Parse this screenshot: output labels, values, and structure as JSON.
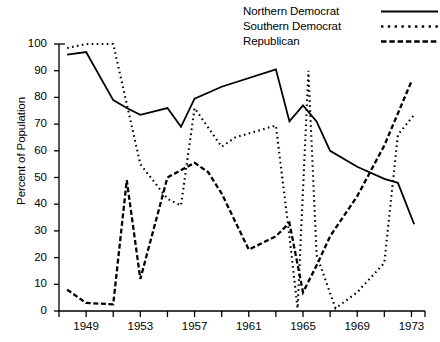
{
  "chart_data": {
    "type": "line",
    "title": "",
    "xlabel": "",
    "ylabel": "Percent of Population",
    "xlim": [
      1947,
      1974
    ],
    "ylim": [
      0,
      100
    ],
    "grid": false,
    "legend_position": "top-right",
    "x_tick_labels": [
      "1949",
      "1953",
      "1957",
      "1961",
      "1965",
      "1969",
      "1973"
    ],
    "x_tick_values": [
      1949,
      1953,
      1957,
      1961,
      1965,
      1969,
      1973
    ],
    "x_minor_tick_values": [
      1947,
      1951,
      1955,
      1959,
      1963,
      1967,
      1971
    ],
    "y_tick_labels": [
      "0",
      "10",
      "20",
      "30",
      "40",
      "50",
      "60",
      "70",
      "80",
      "90",
      "100"
    ],
    "y_tick_values": [
      0,
      10,
      20,
      30,
      40,
      50,
      60,
      70,
      80,
      90,
      100
    ],
    "x": [
      1947,
      1948,
      1949,
      1950,
      1951,
      1952,
      1953,
      1954,
      1955,
      1956,
      1957,
      1958,
      1959,
      1960,
      1961,
      1962,
      1963,
      1964,
      1965,
      1966,
      1967,
      1968,
      1969,
      1970,
      1971,
      1972,
      1973
    ],
    "series": [
      {
        "name": "Northern Democrat",
        "style": "solid",
        "color": "#000000",
        "x": [
          1947.6,
          1949,
          1951,
          1952,
          1953,
          1955,
          1956,
          1957,
          1959,
          1963,
          1964,
          1965,
          1966,
          1967,
          1969,
          1971,
          1972,
          1973.2
        ],
        "values": [
          96,
          97,
          79,
          76,
          73.5,
          76,
          69,
          79.5,
          84,
          90.5,
          71,
          77,
          71,
          60,
          54,
          49.5,
          48,
          32.5
        ]
      },
      {
        "name": "Southern Democrat",
        "style": "dotted",
        "color": "#000000",
        "x": [
          1947.6,
          1949,
          1951,
          1953,
          1955,
          1956,
          1957,
          1959,
          1960,
          1963,
          1964,
          1964.6,
          1965,
          1965.4,
          1966,
          1967.4,
          1969,
          1971,
          1972,
          1973.2
        ],
        "values": [
          98.5,
          100,
          100,
          55,
          42,
          39.5,
          76,
          61.5,
          65,
          69.5,
          28,
          1,
          45,
          90,
          21,
          1,
          7,
          18,
          66,
          73.5
        ]
      },
      {
        "name": "Republican",
        "style": "dashed",
        "color": "#000000",
        "x": [
          1947.6,
          1949,
          1951,
          1952,
          1953,
          1955,
          1957,
          1958,
          1959,
          1961,
          1963,
          1964,
          1965,
          1966,
          1967,
          1969,
          1971,
          1973
        ],
        "values": [
          8,
          3,
          2.5,
          49,
          12,
          50,
          55.5,
          52,
          44,
          23,
          28,
          33,
          7,
          17,
          28,
          43,
          62,
          86
        ]
      }
    ]
  },
  "legend": {
    "items": [
      {
        "label": "Northern Democrat",
        "style": "solid"
      },
      {
        "label": "Southern Democrat",
        "style": "dotted"
      },
      {
        "label": "Republican",
        "style": "dashed"
      }
    ]
  }
}
